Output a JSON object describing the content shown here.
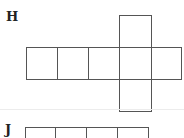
{
  "figures": [
    {
      "label": "H",
      "description": "cube net: row of five squares with one square above and one below the fourth square",
      "squares": [
        {
          "x": 26,
          "y": 47,
          "w": 31,
          "h": 32
        },
        {
          "x": 57,
          "y": 47,
          "w": 31,
          "h": 32
        },
        {
          "x": 88,
          "y": 47,
          "w": 31,
          "h": 32
        },
        {
          "x": 119,
          "y": 47,
          "w": 32,
          "h": 32
        },
        {
          "x": 151,
          "y": 47,
          "w": 31,
          "h": 32
        },
        {
          "x": 119,
          "y": 15,
          "w": 32,
          "h": 33
        },
        {
          "x": 119,
          "y": 78,
          "w": 32,
          "h": 33
        }
      ]
    },
    {
      "label": "J",
      "description": "partial cube net: row of four squares (cropped)",
      "squares": [
        {
          "x": 25,
          "y": 127,
          "w": 31,
          "h": 20
        },
        {
          "x": 55,
          "y": 127,
          "w": 32,
          "h": 20
        },
        {
          "x": 86,
          "y": 127,
          "w": 32,
          "h": 20
        },
        {
          "x": 117,
          "y": 127,
          "w": 32,
          "h": 20
        }
      ]
    }
  ],
  "style": {
    "line_color": "#555555",
    "label_color": "#222222",
    "separator_color": "#ececec"
  }
}
